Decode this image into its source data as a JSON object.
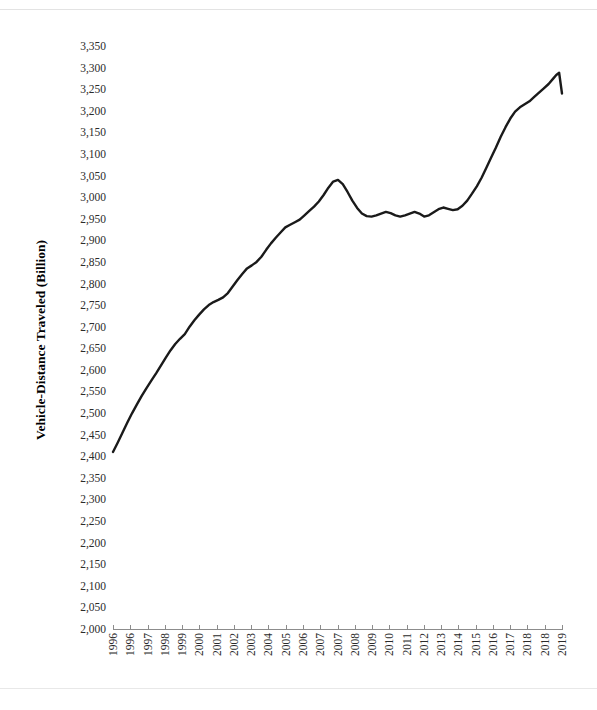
{
  "chart_data": {
    "type": "line",
    "title": "",
    "xlabel": "",
    "ylabel": "Vehicle-Distance Traveled (Billion)",
    "ylim": [
      2000,
      3350
    ],
    "ytick_step": 50,
    "ytick_labels": [
      "3,350",
      "3,300",
      "3,250",
      "3,200",
      "3,150",
      "3,100",
      "3,050",
      "3,000",
      "2,950",
      "2,900",
      "2,850",
      "2,800",
      "2,750",
      "2,700",
      "2,650",
      "2,600",
      "2,550",
      "2,500",
      "2,450",
      "2,400",
      "2,350",
      "2,300",
      "2,250",
      "2,200",
      "2,150",
      "2,100",
      "2,050",
      "2,000"
    ],
    "ytick_values": [
      3350,
      3300,
      3250,
      3200,
      3150,
      3100,
      3050,
      3000,
      2950,
      2900,
      2850,
      2800,
      2750,
      2700,
      2650,
      2600,
      2550,
      2500,
      2450,
      2400,
      2350,
      2300,
      2250,
      2200,
      2150,
      2100,
      2050,
      2000
    ],
    "xtick_labels": [
      "1996",
      "1996",
      "1997",
      "1998",
      "1999",
      "2000",
      "2001",
      "2002",
      "2003",
      "2004",
      "2005",
      "2006",
      "2007",
      "2007",
      "2008",
      "2009",
      "2010",
      "2011",
      "2012",
      "2013",
      "2014",
      "2015",
      "2016",
      "2017",
      "2018",
      "2018",
      "2019"
    ],
    "grid": false,
    "legend": null,
    "line_color": "#1a1a1a",
    "series": [
      {
        "name": "Vehicle-Distance Traveled",
        "x": [
          1996.0,
          1996.25,
          1996.5,
          1996.75,
          1997.0,
          1997.25,
          1997.5,
          1997.75,
          1998.0,
          1998.25,
          1998.5,
          1998.75,
          1999.0,
          1999.25,
          1999.5,
          1999.75,
          2000.0,
          2000.25,
          2000.5,
          2000.75,
          2001.0,
          2001.25,
          2001.5,
          2001.75,
          2002.0,
          2002.25,
          2002.5,
          2002.75,
          2003.0,
          2003.25,
          2003.5,
          2003.75,
          2004.0,
          2004.25,
          2004.5,
          2004.75,
          2005.0,
          2005.25,
          2005.5,
          2005.75,
          2006.0,
          2006.25,
          2006.5,
          2006.75,
          2007.0,
          2007.25,
          2007.5,
          2007.75,
          2008.0,
          2008.25,
          2008.5,
          2008.75,
          2009.0,
          2009.25,
          2009.5,
          2009.75,
          2010.0,
          2010.25,
          2010.5,
          2010.75,
          2011.0,
          2011.25,
          2011.5,
          2011.75,
          2012.0,
          2012.25,
          2012.5,
          2012.75,
          2013.0,
          2013.25,
          2013.5,
          2013.75,
          2014.0,
          2014.25,
          2014.5,
          2014.75,
          2015.0,
          2015.25,
          2015.5,
          2015.75,
          2016.0,
          2016.25,
          2016.5,
          2016.75,
          2017.0,
          2017.25,
          2017.5,
          2017.75,
          2018.0,
          2018.25,
          2018.5,
          2018.75,
          2019.0,
          2019.15,
          2019.3,
          2019.45
        ],
        "values": [
          2410,
          2432,
          2455,
          2478,
          2500,
          2520,
          2540,
          2558,
          2575,
          2592,
          2610,
          2628,
          2645,
          2660,
          2672,
          2683,
          2700,
          2715,
          2728,
          2740,
          2750,
          2757,
          2762,
          2768,
          2778,
          2793,
          2808,
          2822,
          2835,
          2842,
          2850,
          2862,
          2878,
          2893,
          2906,
          2918,
          2930,
          2936,
          2942,
          2948,
          2958,
          2968,
          2978,
          2990,
          3005,
          3022,
          3036,
          3040,
          3030,
          3012,
          2992,
          2975,
          2962,
          2956,
          2955,
          2958,
          2962,
          2966,
          2963,
          2958,
          2955,
          2958,
          2962,
          2966,
          2962,
          2955,
          2958,
          2965,
          2972,
          2976,
          2973,
          2970,
          2972,
          2980,
          2992,
          3008,
          3025,
          3045,
          3068,
          3092,
          3115,
          3140,
          3162,
          3182,
          3198,
          3208,
          3215,
          3222,
          3232,
          3242,
          3252,
          3262,
          3275,
          3283,
          3288,
          3240
        ]
      }
    ]
  },
  "axis": {
    "y_title": "Vehicle-Distance Traveled (Billion)"
  }
}
